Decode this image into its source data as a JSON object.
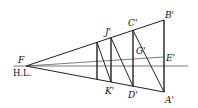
{
  "figure": {
    "type": "perspective-construction",
    "vanishing_point": "F",
    "horizon_label": "H.L.",
    "labels": {
      "F": "F",
      "HL": "H.L.",
      "A": "A'",
      "B": "B'",
      "C": "C'",
      "D": "D'",
      "E": "E'",
      "G": "G'",
      "J": "J'",
      "K": "K'"
    },
    "colors": {
      "line": "#222222",
      "background": "#ffffff"
    }
  }
}
